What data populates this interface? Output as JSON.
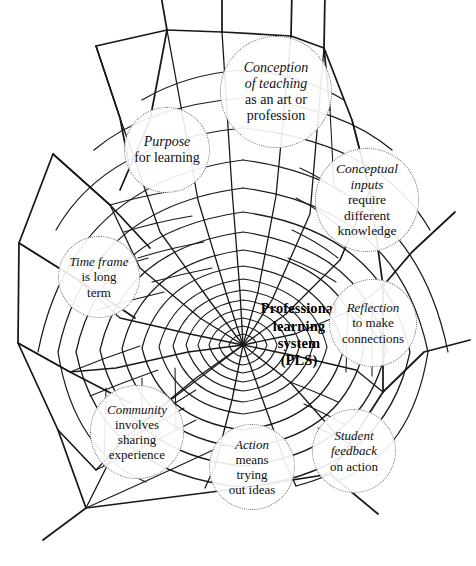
{
  "figure": {
    "type": "concept-diagram",
    "motif": "spider-web",
    "background_color": "#ffffff",
    "line_color": "#181818",
    "bubble_border_color": "#6b6b6b",
    "center": {
      "name": "professional-learning-system",
      "lines": [
        "Professional",
        "learning",
        "system",
        "(PLS)"
      ],
      "style": "bold",
      "x": 243,
      "y": 300,
      "width": 112,
      "height": 70
    },
    "nodes": [
      {
        "id": "conception",
        "name": "conception-of-teaching",
        "lines": [
          {
            "text": "Conception",
            "italic": true
          },
          {
            "text": "of teaching",
            "italic": true
          },
          {
            "text": "as an art or",
            "italic": false
          },
          {
            "text": "profession",
            "italic": false
          }
        ],
        "x": 220,
        "y": 36,
        "size": 112,
        "font_size": 14
      },
      {
        "id": "purpose",
        "name": "purpose-for-learning",
        "lines": [
          {
            "text": "Purpose",
            "italic": true
          },
          {
            "text": "for learning",
            "italic": false
          }
        ],
        "x": 124,
        "y": 107,
        "size": 86,
        "font_size": 14
      },
      {
        "id": "conceptual-inputs",
        "name": "conceptual-inputs",
        "lines": [
          {
            "text": "Conceptual",
            "italic": true
          },
          {
            "text": "inputs",
            "italic": true
          },
          {
            "text": "require",
            "italic": false
          },
          {
            "text": "different",
            "italic": false
          },
          {
            "text": "knowledge",
            "italic": false
          }
        ],
        "x": 315,
        "y": 148,
        "size": 104,
        "font_size": 13.5
      },
      {
        "id": "time-frame",
        "name": "time-frame",
        "lines": [
          {
            "text": "Time frame",
            "italic": true
          },
          {
            "text": "is long",
            "italic": false
          },
          {
            "text": "term",
            "italic": false
          }
        ],
        "x": 58,
        "y": 236,
        "size": 82,
        "font_size": 13
      },
      {
        "id": "reflection",
        "name": "reflection-to-make-connections",
        "lines": [
          {
            "text": "Reflection",
            "italic": true
          },
          {
            "text": "to make",
            "italic": false
          },
          {
            "text": "connections",
            "italic": false
          }
        ],
        "x": 329,
        "y": 279,
        "size": 88,
        "font_size": 13
      },
      {
        "id": "community",
        "name": "community-sharing-experience",
        "lines": [
          {
            "text": "Community",
            "italic": true
          },
          {
            "text": "involves",
            "italic": false
          },
          {
            "text": "sharing",
            "italic": false
          },
          {
            "text": "experience",
            "italic": false
          }
        ],
        "x": 90,
        "y": 385,
        "size": 94,
        "font_size": 13
      },
      {
        "id": "action",
        "name": "action-trying-out-ideas",
        "lines": [
          {
            "text": "Action",
            "italic": true
          },
          {
            "text": "means",
            "italic": false
          },
          {
            "text": "trying",
            "italic": false
          },
          {
            "text": "out ideas",
            "italic": false
          }
        ],
        "x": 209,
        "y": 424,
        "size": 86,
        "font_size": 13
      },
      {
        "id": "student-feedback",
        "name": "student-feedback-on-action",
        "lines": [
          {
            "text": "Student",
            "italic": true
          },
          {
            "text": "feedback",
            "italic": true
          },
          {
            "text": "on action",
            "italic": false
          }
        ],
        "x": 312,
        "y": 409,
        "size": 84,
        "font_size": 13
      }
    ]
  }
}
